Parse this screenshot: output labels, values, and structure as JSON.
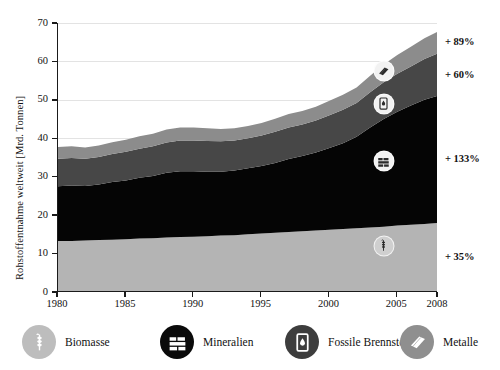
{
  "chart_data": {
    "type": "area",
    "title": "",
    "subtitle": "",
    "xlabel": "",
    "ylabel": "Rohstoffentnahme weltweit [Mrd. Tonnen]",
    "xlim": [
      1980,
      2008
    ],
    "ylim": [
      0,
      70
    ],
    "grid": true,
    "stacked": true,
    "legend_position": "bottom",
    "xticks": [
      "1980",
      "1985",
      "1990",
      "1995",
      "2000",
      "2005",
      "2008"
    ],
    "xtick_values": [
      1980,
      1985,
      1990,
      1995,
      2000,
      2005,
      2008
    ],
    "yticks": [
      "0",
      "10",
      "20",
      "30",
      "40",
      "50",
      "60",
      "70"
    ],
    "ytick_values": [
      0,
      10,
      20,
      30,
      40,
      50,
      60,
      70
    ],
    "x": [
      1980,
      1981,
      1982,
      1983,
      1984,
      1985,
      1986,
      1987,
      1988,
      1989,
      1990,
      1991,
      1992,
      1993,
      1994,
      1995,
      1996,
      1997,
      1998,
      1999,
      2000,
      2001,
      2002,
      2003,
      2004,
      2005,
      2006,
      2007,
      2008
    ],
    "series": [
      {
        "name": "Biomasse",
        "color": "#b4b4b4",
        "growth_label": "+ 35%",
        "values": [
          13.3,
          13.3,
          13.4,
          13.5,
          13.6,
          13.7,
          13.9,
          14.0,
          14.2,
          14.3,
          14.4,
          14.5,
          14.7,
          14.8,
          15.0,
          15.2,
          15.4,
          15.6,
          15.8,
          16.0,
          16.2,
          16.4,
          16.6,
          16.8,
          17.0,
          17.3,
          17.5,
          17.7,
          18.0
        ]
      },
      {
        "name": "Mineralien",
        "color": "#050505",
        "growth_label": "+ 133%",
        "values": [
          14.2,
          14.4,
          14.2,
          14.5,
          15.0,
          15.3,
          15.8,
          16.2,
          16.8,
          17.1,
          17.0,
          16.8,
          16.6,
          16.8,
          17.2,
          17.6,
          18.2,
          19.0,
          19.6,
          20.3,
          21.3,
          22.3,
          23.8,
          26.0,
          28.0,
          29.6,
          31.0,
          32.3,
          33.1
        ]
      },
      {
        "name": "Fossile Brennstoffe",
        "color": "#474747",
        "growth_label": "+ 60%",
        "values": [
          7.2,
          7.2,
          7.1,
          7.1,
          7.3,
          7.5,
          7.6,
          7.7,
          7.9,
          8.0,
          8.0,
          8.0,
          7.9,
          7.8,
          7.8,
          7.9,
          8.1,
          8.2,
          8.2,
          8.3,
          8.5,
          8.7,
          8.8,
          9.2,
          9.6,
          9.9,
          10.2,
          10.6,
          11.0
        ]
      },
      {
        "name": "Metalle",
        "color": "#8c8c8c",
        "growth_label": "+ 89%",
        "values": [
          3.0,
          3.0,
          2.9,
          3.0,
          3.1,
          3.1,
          3.2,
          3.3,
          3.4,
          3.4,
          3.4,
          3.3,
          3.2,
          3.2,
          3.2,
          3.3,
          3.4,
          3.5,
          3.5,
          3.6,
          3.8,
          3.9,
          4.0,
          4.3,
          4.6,
          4.9,
          5.1,
          5.4,
          5.7
        ]
      }
    ],
    "annotations": [
      {
        "name": "metalle-badge",
        "icon": "metal-ingot-icon",
        "x": 2004,
        "y": 57.5,
        "face": "#f2f2f2",
        "ring": "#8c8c8c"
      },
      {
        "name": "fossile-badge",
        "icon": "oil-barrel-icon",
        "x": 2004,
        "y": 49.0,
        "face": "#f2f2f2",
        "ring": "#474747"
      },
      {
        "name": "mineralien-badge",
        "icon": "bricks-icon",
        "x": 2004,
        "y": 34.0,
        "face": "#f2f2f2",
        "ring": "#050505"
      },
      {
        "name": "biomasse-badge",
        "icon": "wheat-icon",
        "x": 2004,
        "y": 12.0,
        "face": "#cfcfcf",
        "ring": "#b4b4b4"
      }
    ]
  },
  "legend": {
    "items": [
      {
        "label": "Biomasse",
        "icon": "wheat-icon",
        "swatch_color": "#bdbdbd",
        "glyph_color": "#ffffff"
      },
      {
        "label": "Mineralien",
        "icon": "bricks-icon",
        "swatch_color": "#0a0a0a",
        "glyph_color": "#ffffff"
      },
      {
        "label": "Fossile Brennstoffe",
        "icon": "oil-barrel-icon",
        "swatch_color": "#3d3d3d",
        "glyph_color": "#ffffff"
      },
      {
        "label": "Metalle",
        "icon": "metal-ingot-icon",
        "swatch_color": "#8f8f8f",
        "glyph_color": "#ffffff"
      }
    ]
  }
}
